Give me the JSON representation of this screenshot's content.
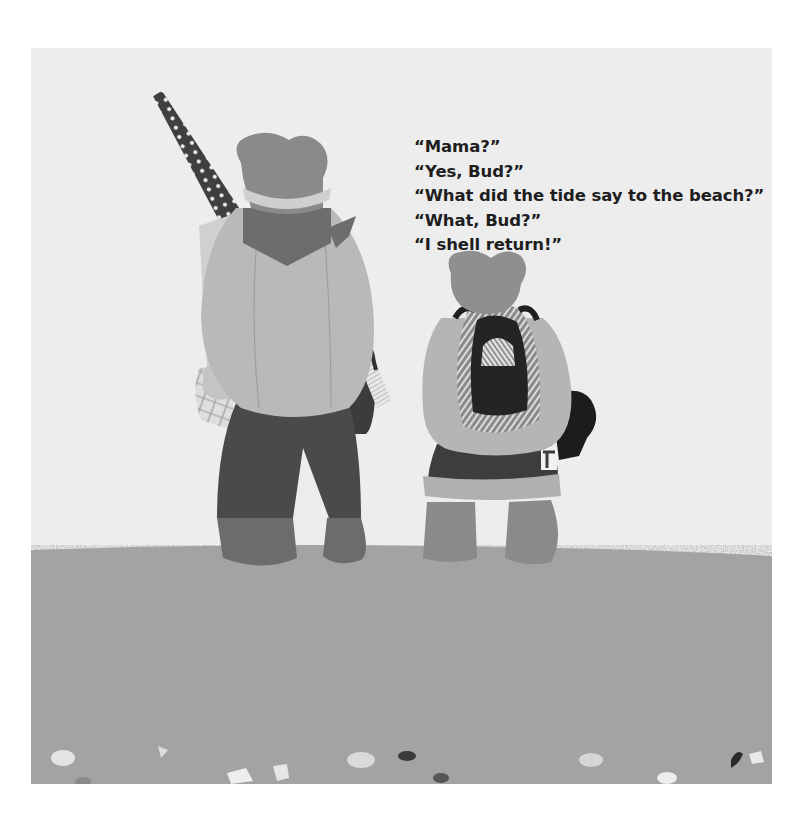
{
  "page": {
    "background": "#ffffff",
    "illustration": {
      "description": "Two paper-cutout bears seen from behind, standing on a sandy beach looking at a cloudy sky",
      "sky_color": "#e6e6e6",
      "sand_color": "#a3a3a3",
      "characters": [
        {
          "name": "Mama",
          "carrying": [
            "polka-dot beach umbrella",
            "folded towel",
            "woven basket",
            "striped bag"
          ]
        },
        {
          "name": "Bud",
          "carrying": [
            "backpack",
            "dark bucket"
          ]
        }
      ]
    },
    "dialogue": [
      "“Mama?”",
      "“Yes, Bud?”",
      "“What did the tide say to the beach?”",
      "“What, Bud?”",
      "“I shell return!”"
    ]
  }
}
